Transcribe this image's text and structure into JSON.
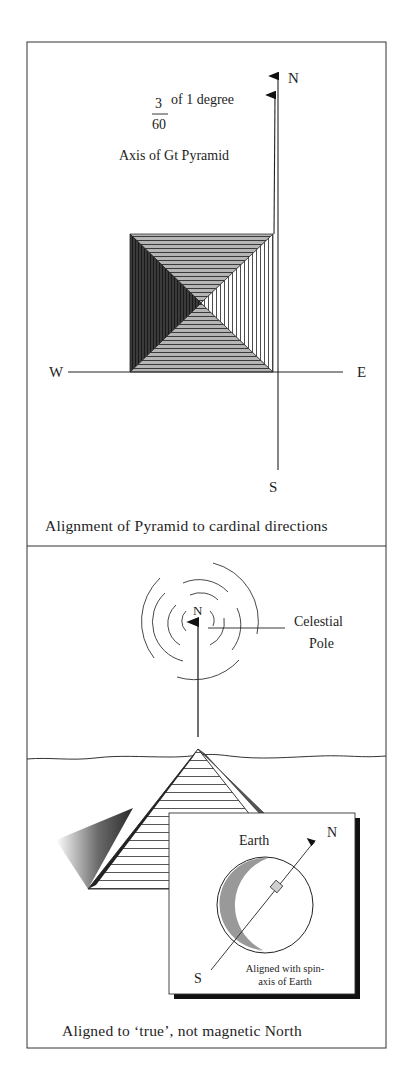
{
  "top_panel": {
    "fraction_numerator": "3",
    "fraction_denominator": "60",
    "fraction_suffix": "of 1 degree",
    "axis_label": "Axis of Gt Pyramid",
    "compass": {
      "north": "N",
      "south": "S",
      "east": "E",
      "west": "W"
    },
    "caption": "Alignment of Pyramid to cardinal directions"
  },
  "bottom_panel": {
    "pole_marker": "N",
    "pole_label_line1": "Celestial",
    "pole_label_line2": "Pole",
    "inset": {
      "title": "Earth",
      "north": "N",
      "south": "S",
      "note_line1": "Aligned with spin-",
      "note_line2": "axis of Earth"
    },
    "caption": "Aligned to ‘true’, not magnetic North"
  },
  "colors": {
    "ink": "#1e1e1e",
    "mid_gray": "#8a8a8a",
    "dark_face": "#2b2b2b",
    "paper": "#ffffff"
  }
}
